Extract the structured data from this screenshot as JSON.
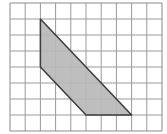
{
  "diagram": {
    "type": "grid-polygon",
    "grid": {
      "columns": 10,
      "rows": 8,
      "origin_px": [
        10,
        3
      ],
      "cell_w": 15.2,
      "cell_h": 16,
      "line_color": "#9a9a9a",
      "border_color": "#8a8a8a"
    },
    "polygon": {
      "vertices_grid": [
        [
          2,
          1
        ],
        [
          2,
          4
        ],
        [
          5,
          7
        ],
        [
          8,
          7
        ]
      ],
      "fill": "#b9b9b9",
      "stroke": "#3c3c3c"
    }
  }
}
